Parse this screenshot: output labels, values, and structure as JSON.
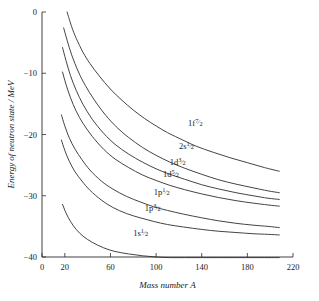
{
  "chart_data": {
    "type": "line",
    "title": "",
    "xlabel": "Mass number A",
    "ylabel": "Energy of neutron state / MeV",
    "xlim": [
      0,
      220
    ],
    "ylim": [
      -40,
      0
    ],
    "grid": false,
    "legend_position": "inline-curve-labels",
    "xticks": [
      0,
      20,
      60,
      100,
      140,
      180,
      220
    ],
    "xtick_labels": [
      "0",
      "20",
      "60",
      "100",
      "140",
      "180",
      "220"
    ],
    "yticks": [
      0,
      -10,
      -20,
      -30,
      -40
    ],
    "ytick_labels": [
      "0",
      "−10",
      "−20",
      "−30",
      "−40"
    ],
    "series": [
      {
        "name": "1f7/2",
        "label_main": "1f",
        "label_sub": "7/2",
        "label_x": 128,
        "label_y": -18.6,
        "x": [
          22,
          26,
          30,
          36,
          42,
          50,
          60,
          70,
          80,
          90,
          100,
          110,
          120,
          135,
          150,
          165,
          180,
          195,
          208
        ],
        "y": [
          0.0,
          -2.4,
          -4.3,
          -6.6,
          -8.4,
          -10.4,
          -12.6,
          -14.4,
          -16.0,
          -17.4,
          -18.6,
          -19.7,
          -20.6,
          -21.9,
          -22.9,
          -23.8,
          -24.6,
          -25.4,
          -26.0
        ]
      },
      {
        "name": "2s1/2",
        "label_main": "2s",
        "label_sub": "1/2",
        "label_x": 120,
        "label_y": -22.4,
        "x": [
          19,
          22,
          26,
          32,
          38,
          46,
          56,
          66,
          76,
          88,
          100,
          112,
          125,
          140,
          155,
          170,
          185,
          198,
          208
        ],
        "y": [
          -2.6,
          -4.6,
          -7.0,
          -9.8,
          -12.0,
          -14.4,
          -16.9,
          -18.9,
          -20.5,
          -22.1,
          -23.4,
          -24.5,
          -25.5,
          -26.5,
          -27.4,
          -28.1,
          -28.7,
          -29.2,
          -29.5
        ]
      },
      {
        "name": "1d3/2",
        "label_main": "1d",
        "label_sub": "3/2",
        "label_x": 112,
        "label_y": -25.0,
        "x": [
          18,
          21,
          25,
          30,
          36,
          44,
          54,
          64,
          76,
          88,
          100,
          112,
          125,
          140,
          155,
          170,
          185,
          198,
          208
        ],
        "y": [
          -5.8,
          -7.9,
          -10.4,
          -12.8,
          -15.1,
          -17.5,
          -19.8,
          -21.6,
          -23.2,
          -24.5,
          -25.6,
          -26.5,
          -27.3,
          -28.2,
          -28.9,
          -29.5,
          -30.0,
          -30.4,
          -30.6
        ]
      },
      {
        "name": "1d5/2",
        "label_main": "1d",
        "label_sub": "5/2",
        "label_x": 106,
        "label_y": -27.0,
        "x": [
          18,
          21,
          25,
          30,
          36,
          44,
          54,
          64,
          76,
          88,
          100,
          112,
          125,
          140,
          155,
          170,
          185,
          198,
          208
        ],
        "y": [
          -9.8,
          -11.8,
          -14.0,
          -16.2,
          -18.2,
          -20.3,
          -22.4,
          -24.0,
          -25.4,
          -26.6,
          -27.5,
          -28.3,
          -29.0,
          -29.7,
          -30.3,
          -30.8,
          -31.2,
          -31.5,
          -31.7
        ]
      },
      {
        "name": "1p1/2",
        "label_main": "1p",
        "label_sub": "1/2",
        "label_x": 98,
        "label_y": -29.9,
        "x": [
          17,
          20,
          24,
          29,
          35,
          42,
          52,
          62,
          74,
          86,
          98,
          110,
          124,
          140,
          155,
          170,
          185,
          198,
          208
        ],
        "y": [
          -16.8,
          -18.6,
          -20.6,
          -22.4,
          -24.1,
          -25.8,
          -27.6,
          -28.9,
          -30.1,
          -31.0,
          -31.8,
          -32.4,
          -33.0,
          -33.6,
          -34.1,
          -34.5,
          -34.8,
          -35.0,
          -35.2
        ]
      },
      {
        "name": "1p3/2",
        "label_main": "1p",
        "label_sub": "3/2",
        "label_x": 90,
        "label_y": -32.5,
        "x": [
          17,
          20,
          24,
          29,
          35,
          42,
          52,
          62,
          74,
          86,
          98,
          110,
          124,
          140,
          155,
          170,
          185,
          198,
          208
        ],
        "y": [
          -20.9,
          -22.6,
          -24.4,
          -26.1,
          -27.6,
          -29.1,
          -30.7,
          -31.9,
          -32.9,
          -33.6,
          -34.2,
          -34.7,
          -35.1,
          -35.5,
          -35.8,
          -36.0,
          -36.2,
          -36.3,
          -36.4
        ]
      },
      {
        "name": "1s1/2",
        "label_main": "1s",
        "label_sub": "1/2",
        "label_x": 80,
        "label_y": -36.6,
        "x": [
          18,
          21,
          25,
          30,
          36,
          44,
          54,
          64,
          76,
          88,
          100,
          112,
          125,
          140,
          155,
          170,
          185,
          198,
          208
        ],
        "y": [
          -31.4,
          -32.8,
          -34.2,
          -35.5,
          -36.6,
          -37.6,
          -38.5,
          -39.1,
          -39.5,
          -39.8,
          -40.0,
          -40.1,
          -40.1,
          -40.1,
          -40.1,
          -40.1,
          -40.1,
          -40.1,
          -40.1
        ]
      }
    ]
  }
}
